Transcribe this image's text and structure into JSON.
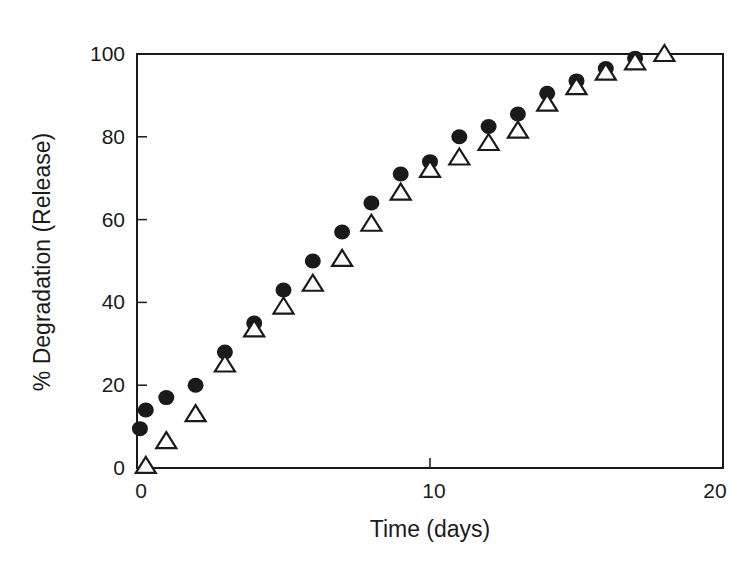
{
  "chart_data": {
    "type": "scatter",
    "title": "",
    "xlabel": "Time (days)",
    "ylabel": "% Degradation (Release)",
    "xlim": [
      0,
      20
    ],
    "ylim": [
      0,
      100
    ],
    "x_ticks": [
      0,
      10,
      20
    ],
    "y_ticks": [
      0,
      20,
      40,
      60,
      80,
      100
    ],
    "grid": false,
    "legend": null,
    "series": [
      {
        "name": "filled circles",
        "marker": "filled-circle",
        "color": "#1a1a1a",
        "x": [
          0.1,
          0.3,
          1,
          2,
          3,
          4,
          5,
          6,
          7,
          8,
          9,
          10,
          11,
          12,
          13,
          14,
          15,
          16,
          17
        ],
        "y": [
          9.5,
          14,
          17,
          20,
          28,
          35,
          43,
          50,
          57,
          64,
          71,
          74,
          80,
          82.5,
          85.5,
          90.5,
          93.5,
          96.5,
          99
        ]
      },
      {
        "name": "open triangles",
        "marker": "open-triangle",
        "color": "#1a1a1a",
        "x": [
          0.3,
          1,
          2,
          3,
          4,
          5,
          6,
          7,
          8,
          9,
          10,
          11,
          12,
          13,
          14,
          15,
          16,
          17,
          18
        ],
        "y": [
          0.5,
          6.5,
          13,
          25,
          33.5,
          39,
          44.5,
          50.5,
          59,
          66.5,
          72,
          75,
          78.5,
          81.5,
          88,
          92,
          95.5,
          98,
          100
        ]
      }
    ]
  }
}
